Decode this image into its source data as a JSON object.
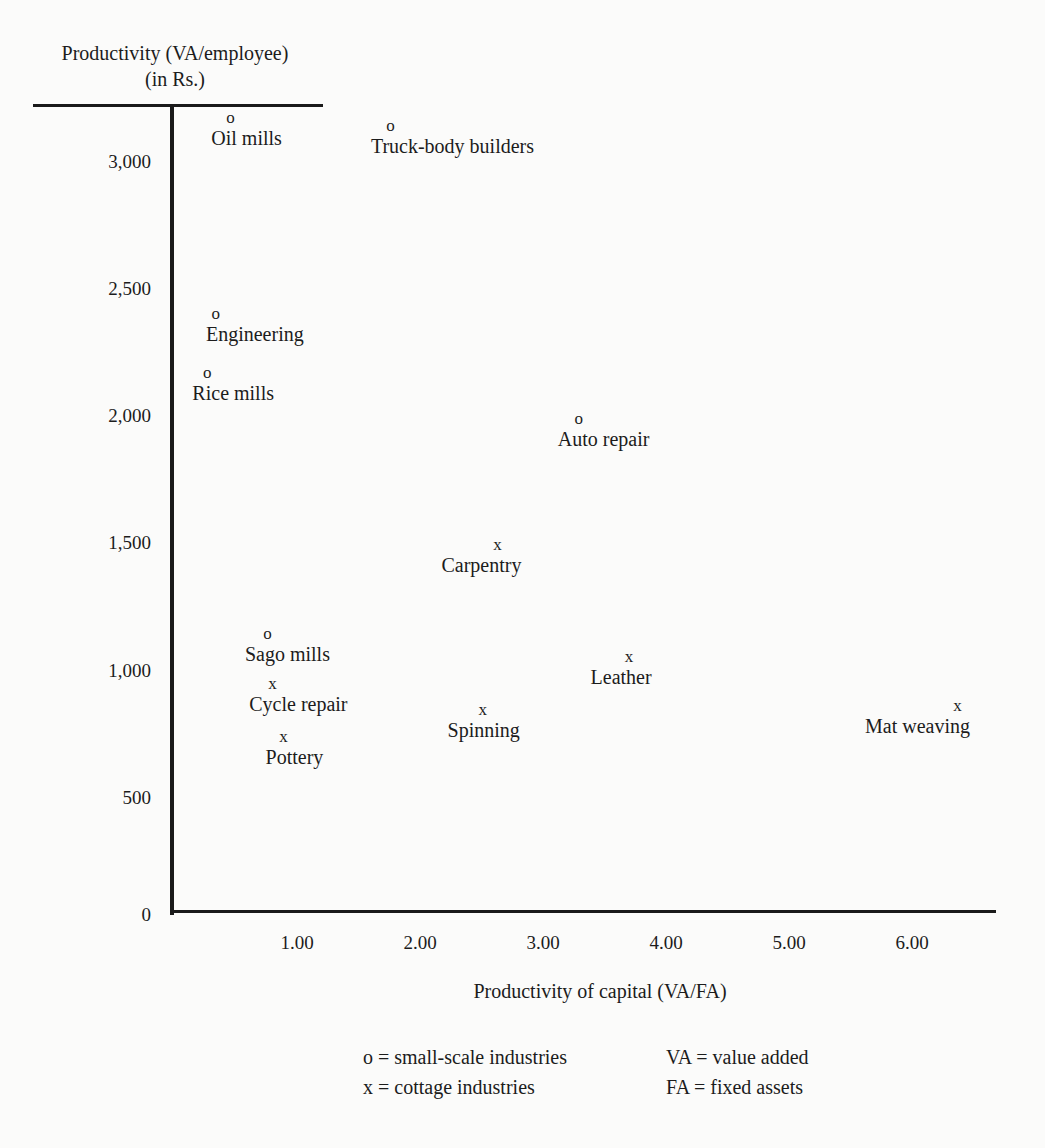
{
  "chart_data": {
    "type": "scatter",
    "title": "",
    "xlabel": "Productivity of capital (VA/FA)",
    "ylabel": "Productivity (VA/employee) (in Rs.)",
    "ylabel_lines": [
      "Productivity (VA/employee)",
      "(in Rs.)"
    ],
    "xlim": [
      0,
      6.6
    ],
    "ylim": [
      0,
      3200
    ],
    "x_ticks": [
      {
        "value": 1,
        "label": "1.00"
      },
      {
        "value": 2,
        "label": "2.00"
      },
      {
        "value": 3,
        "label": "3.00"
      },
      {
        "value": 4,
        "label": "4.00"
      },
      {
        "value": 5,
        "label": "5.00"
      },
      {
        "value": 6,
        "label": "6.00"
      }
    ],
    "y_ticks": [
      {
        "value": 0,
        "label": "0"
      },
      {
        "value": 500,
        "label": "500"
      },
      {
        "value": 1000,
        "label": "1,000"
      },
      {
        "value": 1500,
        "label": "1,500"
      },
      {
        "value": 2000,
        "label": "2,000"
      },
      {
        "value": 2500,
        "label": "2,500"
      },
      {
        "value": 3000,
        "label": "3,000"
      }
    ],
    "grid": false,
    "series": [
      {
        "name": "small-scale industries",
        "marker": "o",
        "points": [
          {
            "label": "Oil mills",
            "x": 0.46,
            "y": 3170
          },
          {
            "label": "Truck-body builders",
            "x": 1.76,
            "y": 3140
          },
          {
            "label": "Engineering",
            "x": 0.34,
            "y": 2400
          },
          {
            "label": "Rice mills",
            "x": 0.27,
            "y": 2170
          },
          {
            "label": "Auto repair",
            "x": 3.29,
            "y": 1990
          },
          {
            "label": "Sago mills",
            "x": 0.76,
            "y": 1145
          }
        ]
      },
      {
        "name": "cottage industries",
        "marker": "x",
        "points": [
          {
            "label": "Carpentry",
            "x": 2.63,
            "y": 1495
          },
          {
            "label": "Leather",
            "x": 3.7,
            "y": 1055
          },
          {
            "label": "Cycle repair",
            "x": 0.8,
            "y": 945
          },
          {
            "label": "Spinning",
            "x": 2.51,
            "y": 845
          },
          {
            "label": "Mat weaving",
            "x": 6.37,
            "y": 860
          },
          {
            "label": "Pottery",
            "x": 0.89,
            "y": 740
          }
        ]
      }
    ],
    "legend": {
      "position": "bottom",
      "entries": [
        {
          "symbol": "o",
          "text": "small-scale industries"
        },
        {
          "symbol": "x",
          "text": "cottage industries"
        }
      ],
      "abbreviations": [
        {
          "abbr": "VA",
          "text": "value added"
        },
        {
          "abbr": "FA",
          "text": "fixed assets"
        }
      ]
    }
  }
}
